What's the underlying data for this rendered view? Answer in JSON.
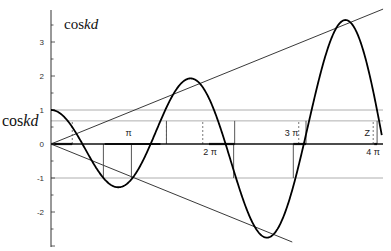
{
  "chart_data": {
    "type": "line",
    "title": "coskd",
    "title_parts": {
      "plain": "cos",
      "italic": "kd"
    },
    "ylabel": "coskd",
    "ylabel_parts": {
      "plain": "cos",
      "italic": "kd"
    },
    "xlabel": "",
    "xlim_radians": [
      0,
      12.8
    ],
    "ylim": [
      -3,
      4
    ],
    "yticks": [
      3,
      2,
      1,
      0,
      -1,
      -2
    ],
    "ytick_labels": [
      "3",
      "2",
      "1",
      "0",
      "-1",
      "-2"
    ],
    "xtick_labels": [
      {
        "label": "π",
        "x_over_pi": 1.0,
        "side": "above"
      },
      {
        "label": "2 π",
        "x_over_pi": 2.0,
        "side": "below"
      },
      {
        "label": "3 π",
        "x_over_pi": 3.0,
        "side": "above"
      },
      {
        "label": "4 π",
        "x_over_pi": 4.0,
        "side": "below"
      }
    ],
    "annotations": [
      {
        "label": "Z",
        "x_over_pi": 3.93,
        "y": 0.35
      }
    ],
    "reference_lines": [
      {
        "name": "upper-bound",
        "y": 1
      },
      {
        "name": "coskd-level",
        "y": 0.68
      },
      {
        "name": "lower-bound",
        "y": -1
      }
    ],
    "series": [
      {
        "name": "f(x) = cos x − P·x·sin x",
        "P": 0.31,
        "x_range_radians": [
          0,
          12.75
        ]
      }
    ],
    "envelopes": [
      {
        "name": "upper-envelope",
        "slope_per_radian": 0.31,
        "x_end_radians": 12.8
      },
      {
        "name": "lower-envelope",
        "slope_per_radian": -0.31,
        "x_end_radians": 9.3
      }
    ],
    "allowed_bands_radians": [
      [
        0,
        0.82
      ],
      [
        2.07,
        4.22
      ],
      [
        6.09,
        7.08
      ],
      [
        9.34,
        9.83
      ],
      [
        12.46,
        12.57
      ]
    ],
    "band_markers": {
      "dashed_at_coskd": [
        0.82,
        4.45,
        5.85,
        9.55,
        12.42
      ],
      "lower_boxes_radians": [
        [
          2.02,
          3.1
        ],
        [
          7.04,
          9.34
        ]
      ],
      "upper_boxes_radians": [
        [
          4.45,
          4.45
        ],
        [
          7.08,
          7.08
        ],
        [
          9.83,
          9.83
        ],
        [
          12.57,
          12.57
        ]
      ]
    },
    "grid": false,
    "legend": "none"
  }
}
